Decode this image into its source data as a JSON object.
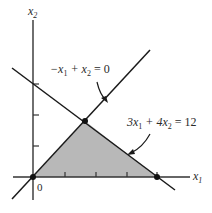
{
  "diagram": {
    "type": "linear-programming-feasible-region",
    "axes": {
      "x_label": "x",
      "x_sub": "1",
      "y_label": "x",
      "y_sub": "2",
      "origin_label": "0",
      "x_ticks": [
        1,
        2,
        3,
        4
      ],
      "y_ticks": [
        1,
        2,
        3
      ]
    },
    "constraints": [
      {
        "id": "line1",
        "label_parts": [
          "−x",
          "1",
          " + x",
          "2",
          " = 0"
        ],
        "equation": "-x1 + x2 = 0"
      },
      {
        "id": "line2",
        "label_parts": [
          "3x",
          "1",
          " + 4x",
          "2",
          " = 12"
        ],
        "equation": "3x1 + 4x2 = 12"
      }
    ],
    "feasible_region": {
      "vertices": [
        [
          0,
          0
        ],
        [
          1.714,
          1.714
        ],
        [
          4,
          0
        ]
      ],
      "fill_color": "#b8b8b8"
    },
    "highlighted_points": [
      [
        0,
        0
      ],
      [
        1.714,
        1.714
      ],
      [
        4,
        0
      ]
    ],
    "colors": {
      "line": "#1a1a1a",
      "axis": "#333333",
      "region": "#b8b8b8"
    }
  }
}
